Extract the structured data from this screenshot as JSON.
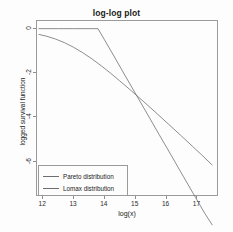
{
  "chart_data": {
    "type": "line",
    "title": "log-log plot",
    "xlabel": "log(x)",
    "ylabel": "logged survival function",
    "xlim": [
      11.8,
      17.7
    ],
    "ylim": [
      -7.6,
      0.35
    ],
    "grid": false,
    "legend_position": "bottom-left",
    "xticks": [
      "12",
      "13",
      "14",
      "15",
      "16",
      "17"
    ],
    "xtick_values": [
      12,
      13,
      14,
      15,
      16,
      17
    ],
    "yticks": [
      "0",
      "-2",
      "-4",
      "-6"
    ],
    "ytick_values": [
      0,
      -2,
      -4,
      -6
    ],
    "series": [
      {
        "name": "Pareto distribution",
        "color": "#6e6e6e",
        "x": [
          11.85,
          12.5,
          13.0,
          13.5,
          13.8,
          14.0,
          14.3,
          14.6,
          15.0,
          15.4,
          15.8,
          16.2,
          16.6,
          17.0,
          17.3,
          17.55
        ],
        "y": [
          0.0,
          0.0,
          0.0,
          0.0,
          0.0,
          -0.48,
          -1.2,
          -1.93,
          -2.9,
          -3.86,
          -4.83,
          -5.79,
          -6.76,
          -7.72,
          -8.44,
          -8.98
        ]
      },
      {
        "name": "Lomax distribution",
        "color": "#6e6e6e",
        "x": [
          11.85,
          12.1,
          12.4,
          12.7,
          13.0,
          13.3,
          13.6,
          13.9,
          14.2,
          14.5,
          14.9,
          15.3,
          15.7,
          16.1,
          16.5,
          16.9,
          17.2,
          17.55
        ],
        "y": [
          -0.26,
          -0.34,
          -0.47,
          -0.64,
          -0.85,
          -1.1,
          -1.38,
          -1.69,
          -2.02,
          -2.37,
          -2.85,
          -3.34,
          -3.84,
          -4.35,
          -4.86,
          -5.38,
          -5.77,
          -6.24
        ]
      }
    ]
  },
  "legend": {
    "entries": [
      {
        "label": "Pareto distribution",
        "color": "#6e6e6e"
      },
      {
        "label": "Lomax distribution",
        "color": "#6e6e6e"
      }
    ]
  }
}
